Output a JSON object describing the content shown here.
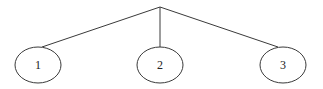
{
  "diagram": {
    "type": "tree",
    "root": {
      "x": 160,
      "y": 7
    },
    "nodes": [
      {
        "label": "1",
        "cx": 38,
        "cy": 65,
        "rx": 23,
        "ry": 18,
        "edge_end": {
          "x": 42,
          "y": 47
        }
      },
      {
        "label": "2",
        "cx": 160,
        "cy": 65,
        "rx": 23,
        "ry": 18,
        "edge_end": {
          "x": 160,
          "y": 47
        }
      },
      {
        "label": "3",
        "cx": 283,
        "cy": 65,
        "rx": 23,
        "ry": 18,
        "edge_end": {
          "x": 278,
          "y": 47
        }
      }
    ],
    "colors": {
      "stroke": "#3a3a3a",
      "text": "#222222",
      "background": "#ffffff"
    }
  }
}
